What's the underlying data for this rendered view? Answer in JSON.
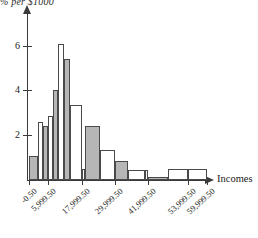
{
  "chart_data": {
    "type": "bar",
    "title": "% per $1000",
    "xlabel": "Incomes",
    "ylabel": "% per $1000",
    "grid": false,
    "legend": "none",
    "ylim": [
      0,
      6.8
    ],
    "xlim": [
      -0.5,
      62000
    ],
    "ytick_labels": [
      "2",
      "4",
      "6"
    ],
    "ytick_values": [
      2,
      4,
      6
    ],
    "xtick_labels": [
      "-0.50",
      "5,999.50",
      "17,999.50",
      "29,999.50",
      "41,999.50",
      "53,999.50",
      "59,999.50"
    ],
    "xtick_values": [
      -0.5,
      5999.5,
      17999.5,
      29999.5,
      41999.5,
      53999.5,
      59999.5
    ],
    "categories": [
      "-0.50 to 1,999.50",
      "1,999.50 to 3,999.50",
      "3,999.50 to 5,999.50",
      "5,999.50 to 7,999.50",
      "7,999.50 to 9,999.50",
      "9,999.50 to 11,999.50",
      "11,999.50 to 13,999.50",
      "13,999.50 to 15,999.50",
      "15,999.50 to 17,999.50",
      "17,999.50 to 21,999.50",
      "21,999.50 to 25,999.50",
      "25,999.50 to 29,999.50",
      "29,999.50 to 35,999.50",
      "35,999.50 to 41,999.50",
      "41,999.50 to 47,999.50",
      "47,999.50 to 53,999.50",
      "53,999.50 to 59,999.50",
      "59,999.50 to 65,999.50"
    ],
    "values": [
      1.05,
      2.6,
      2.4,
      2.85,
      4.0,
      6.05,
      5.4,
      3.35,
      3.35,
      2.4,
      1.35,
      0.85,
      0.45,
      0.1,
      0.1,
      0.45,
      0.45,
      0.45
    ],
    "bars": [
      {
        "x0": 29,
        "x1": 38,
        "height": 1.05,
        "fill": "gray",
        "value": 1.05
      },
      {
        "x0": 38,
        "x1": 43,
        "height": 2.6,
        "fill": "white",
        "value": 2.6
      },
      {
        "x0": 43,
        "x1": 48,
        "height": 2.4,
        "fill": "gray",
        "value": 2.4
      },
      {
        "x0": 48,
        "x1": 53,
        "height": 2.85,
        "fill": "white",
        "value": 2.85
      },
      {
        "x0": 53,
        "x1": 58,
        "height": 4.0,
        "fill": "gray",
        "value": 4.0
      },
      {
        "x0": 58,
        "x1": 64,
        "height": 6.05,
        "fill": "white",
        "value": 6.05
      },
      {
        "x0": 64,
        "x1": 70,
        "height": 5.4,
        "fill": "gray",
        "value": 5.4
      },
      {
        "x0": 70,
        "x1": 82,
        "height": 3.35,
        "fill": "white",
        "value": 3.35
      },
      {
        "x0": 82,
        "x1": 85,
        "height": 0.5,
        "fill": "white",
        "value": 0.5
      },
      {
        "x0": 85,
        "x1": 100,
        "height": 2.4,
        "fill": "gray",
        "value": 2.4
      },
      {
        "x0": 100,
        "x1": 115,
        "height": 1.35,
        "fill": "white",
        "value": 1.35
      },
      {
        "x0": 115,
        "x1": 128,
        "height": 0.85,
        "fill": "gray",
        "value": 0.85
      },
      {
        "x0": 128,
        "x1": 145,
        "height": 0.45,
        "fill": "white",
        "value": 0.45
      },
      {
        "x0": 145,
        "x1": 148,
        "height": 0.45,
        "fill": "white",
        "value": 0.45
      },
      {
        "x0": 148,
        "x1": 168,
        "height": 0.12,
        "fill": "gray",
        "value": 0.12
      },
      {
        "x0": 168,
        "x1": 188,
        "height": 0.48,
        "fill": "white",
        "value": 0.48
      },
      {
        "x0": 188,
        "x1": 207,
        "height": 0.48,
        "fill": "white",
        "value": 0.48
      }
    ]
  },
  "axes": {
    "y_title": "% per $1000",
    "x_title": "Incomes"
  }
}
